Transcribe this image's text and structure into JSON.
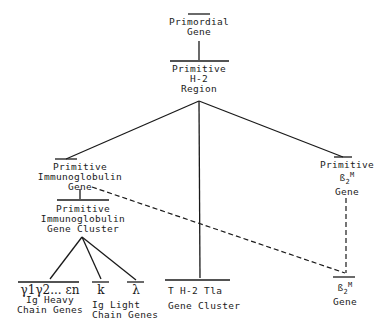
{
  "diagram": {
    "type": "gene-evolution-tree",
    "nodes": {
      "primordial": {
        "lines": [
          "Primordial",
          "Gene"
        ]
      },
      "h2_region": {
        "lines": [
          "Primitive",
          "H-2",
          "Region"
        ]
      },
      "ig_gene": {
        "lines": [
          "Primitive",
          "Immunoglobulin",
          "Gene"
        ]
      },
      "ig_cluster": {
        "lines": [
          "Primitive",
          "Immunoglobulin",
          "Gene Cluster"
        ]
      },
      "b2m_primitive": {
        "lines": [
          "Primitive",
          "B2M",
          "Gene"
        ],
        "symbol": "ß",
        "sub": "2",
        "sup": "M"
      },
      "heavy": {
        "symbol": "γ1γ2... εn",
        "lines": [
          "Ig Heavy",
          "Chain Genes"
        ]
      },
      "kappa": {
        "symbol": "k"
      },
      "lambda": {
        "symbol": "λ"
      },
      "light_label": {
        "lines": [
          "Ig Light",
          "Chain Genes"
        ]
      },
      "th2": {
        "lines": [
          "T H-2 Tla",
          "Gene Cluster"
        ]
      },
      "b2m": {
        "symbol": "ß",
        "sub": "2",
        "sup": "M",
        "lines": [
          "Gene"
        ]
      }
    },
    "edges": [
      {
        "from": "primordial",
        "to": "h2_region",
        "style": "solid"
      },
      {
        "from": "h2_region",
        "to": "ig_gene",
        "style": "solid"
      },
      {
        "from": "h2_region",
        "to": "th2",
        "style": "solid"
      },
      {
        "from": "h2_region",
        "to": "b2m_primitive",
        "style": "solid"
      },
      {
        "from": "ig_gene",
        "to": "ig_cluster",
        "style": "solid"
      },
      {
        "from": "ig_cluster",
        "to": "heavy",
        "style": "solid"
      },
      {
        "from": "ig_cluster",
        "to": "kappa",
        "style": "solid"
      },
      {
        "from": "ig_cluster",
        "to": "lambda",
        "style": "solid"
      },
      {
        "from": "ig_gene",
        "to": "b2m",
        "style": "dashed"
      },
      {
        "from": "b2m_primitive",
        "to": "b2m",
        "style": "dashed"
      }
    ]
  }
}
